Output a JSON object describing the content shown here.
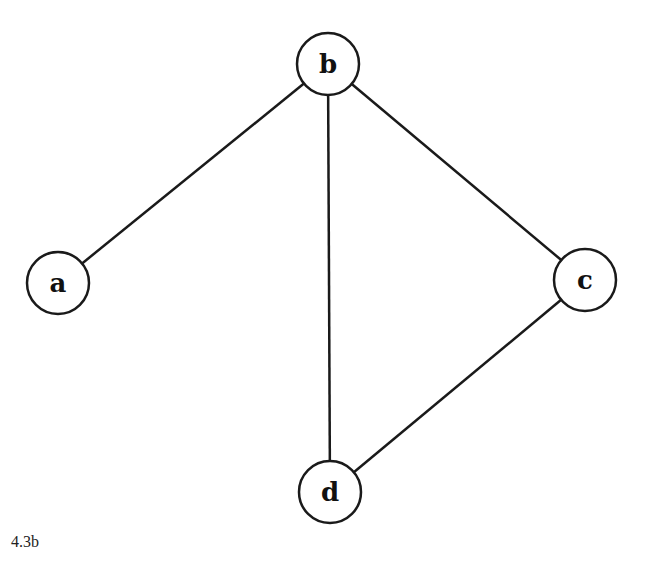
{
  "diagram": {
    "type": "undirected-graph",
    "caption": "4.3b",
    "nodes": [
      {
        "id": "a",
        "label": "a",
        "x": 58,
        "y": 283,
        "r": 31
      },
      {
        "id": "b",
        "label": "b",
        "x": 328,
        "y": 64,
        "r": 31
      },
      {
        "id": "c",
        "label": "c",
        "x": 585,
        "y": 280,
        "r": 31
      },
      {
        "id": "d",
        "label": "d",
        "x": 330,
        "y": 492,
        "r": 31
      }
    ],
    "edges": [
      {
        "from": "b",
        "to": "a"
      },
      {
        "from": "b",
        "to": "d"
      },
      {
        "from": "b",
        "to": "c"
      },
      {
        "from": "c",
        "to": "d"
      }
    ],
    "colors": {
      "stroke": "#1a1a1a",
      "background": "#ffffff"
    }
  }
}
